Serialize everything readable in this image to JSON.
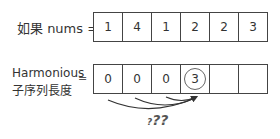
{
  "row1": {
    "label": "如果 nums =",
    "values": [
      "1",
      "4",
      "1",
      "2",
      "2",
      "3"
    ]
  },
  "row2": {
    "label_line1": "Harmonious",
    "label_line2": "子序列長度",
    "equals": "=",
    "values": [
      "0",
      "0",
      "0",
      "3",
      "",
      ""
    ],
    "highlighted_index": 3
  },
  "annotation": {
    "question_small": "?",
    "question_big": "??"
  },
  "colors": {
    "border": "#444444",
    "text": "#333333",
    "arrow": "#333333"
  }
}
